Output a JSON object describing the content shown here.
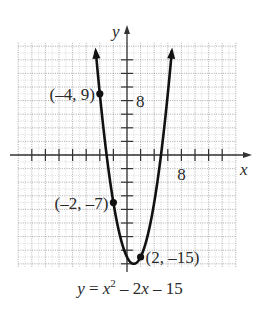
{
  "chart_data": {
    "type": "line",
    "title": "",
    "equation": "y = x^2 - 2x - 15",
    "equation_parts": {
      "lhs": "y",
      "eq": " = ",
      "x": "x",
      "exp": "2",
      "rest1": " – 2",
      "x2": "x",
      "rest2": " – 15"
    },
    "xlabel": "x",
    "ylabel": "y",
    "xlim": [
      -16,
      16
    ],
    "ylim": [
      -16.5,
      16.5
    ],
    "tick_step": 2,
    "grid_step": 1,
    "grid": true,
    "x_tick_labels": [
      {
        "value": 8,
        "label": "8"
      }
    ],
    "y_tick_labels": [
      {
        "value": 8,
        "label": "8"
      }
    ],
    "curve": {
      "a": 1,
      "b": -2,
      "c": -15,
      "x_range": [
        -4.6,
        6.6
      ]
    },
    "labeled_points": [
      {
        "x": -4,
        "y": 9,
        "label": "(–4, 9)",
        "label_side": "left"
      },
      {
        "x": -2,
        "y": -7,
        "label": "(–2, –7)",
        "label_side": "left"
      },
      {
        "x": 2,
        "y": -15,
        "label": "(2, –15)",
        "label_side": "right"
      }
    ],
    "vertex": {
      "x": 1,
      "y": -16
    }
  },
  "colors": {
    "curve": "#111111",
    "axis": "#333333",
    "grid": "#9a9a9a",
    "text": "#2a2a2a"
  }
}
